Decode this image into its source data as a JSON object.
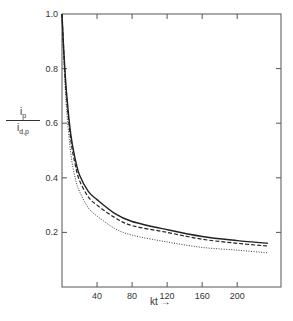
{
  "chart_data": {
    "type": "line",
    "title": "",
    "xlabel": "kt",
    "xlabel_arrow": "→",
    "ylabel": {
      "numerator": "i",
      "numerator_sub": "p",
      "denominator": "i",
      "denominator_sub": "d,p"
    },
    "xlim": [
      0,
      250
    ],
    "ylim": [
      0,
      1.0
    ],
    "xticks": [
      40,
      80,
      120,
      160,
      200
    ],
    "yticks": [
      0.2,
      0.4,
      0.6,
      0.8,
      1.0
    ],
    "ytick_labels": [
      "0.2",
      "0.4",
      "0.6",
      "0.8",
      "1.0"
    ],
    "xtick_labels": [
      "40",
      "80",
      "120",
      "160",
      "200"
    ],
    "grid": false,
    "legend": null,
    "mirror_ticks": true,
    "series": [
      {
        "name": "solid",
        "style": "solid",
        "x": [
          0,
          2,
          5,
          10,
          15,
          20,
          30,
          40,
          60,
          80,
          120,
          160,
          200,
          235
        ],
        "values": [
          1.0,
          0.87,
          0.72,
          0.56,
          0.47,
          0.41,
          0.35,
          0.32,
          0.27,
          0.24,
          0.21,
          0.185,
          0.17,
          0.16
        ]
      },
      {
        "name": "dashed",
        "style": "dashed",
        "x": [
          0,
          2,
          5,
          10,
          15,
          20,
          30,
          40,
          60,
          80,
          120,
          160,
          200,
          235
        ],
        "values": [
          1.0,
          0.86,
          0.7,
          0.54,
          0.45,
          0.39,
          0.33,
          0.3,
          0.255,
          0.225,
          0.2,
          0.175,
          0.16,
          0.15
        ]
      },
      {
        "name": "dotted",
        "style": "dotted",
        "x": [
          0,
          2,
          5,
          10,
          15,
          20,
          30,
          40,
          60,
          80,
          120,
          160,
          200,
          235
        ],
        "values": [
          1.0,
          0.84,
          0.66,
          0.49,
          0.4,
          0.35,
          0.29,
          0.26,
          0.215,
          0.19,
          0.165,
          0.145,
          0.135,
          0.125
        ]
      }
    ]
  },
  "colors": {
    "axis": "#444444",
    "line": "#222222",
    "text": "#333333"
  }
}
